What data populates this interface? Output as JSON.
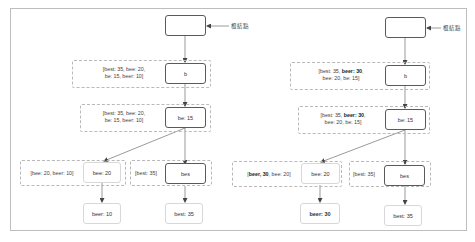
{
  "diagram": {
    "colors": {
      "edge": "#555555",
      "dashed": "#b9b9b9",
      "dark_border": "#5a5a5a",
      "light_border": "#d8d8d8"
    },
    "left_tree": {
      "root_label": "根結點",
      "root_node": "",
      "nodes": {
        "b": "b",
        "be": "be: 15",
        "bee": "bee: 20",
        "bes": "bes",
        "beer": "beer: 10",
        "best": "best: 35"
      },
      "annotations": {
        "b_line1": "[best: 35, bee: 20,",
        "b_line2": "be: 15, beer: 10]",
        "be_line1": "[best: 35, bee: 20,",
        "be_line2": "be: 15, beer: 10]",
        "bee": "[bee: 20, beer: 10]",
        "bes": "[best: 35]"
      }
    },
    "right_tree": {
      "root_label": "根結點",
      "root_node": "",
      "nodes": {
        "b": "b",
        "be": "be: 15",
        "bee": "bee: 20",
        "bes": "bes",
        "beer": "beer: 30",
        "best": "best: 35"
      },
      "annotations": {
        "b_line1_pre": "[best: 35, ",
        "b_line1_bold": "beer: 30",
        "b_line1_post": ",",
        "b_line2": "bee: 20, be: 15]",
        "be_line1_pre": "[best: 35, ",
        "be_line1_bold": "beer: 30",
        "be_line1_post": ",",
        "be_line2": "bee: 20, be: 15]",
        "bee_pre": "[",
        "bee_bold": "beer, 30",
        "bee_post": ", bee: 20]",
        "bes": "[best: 35]"
      }
    }
  }
}
